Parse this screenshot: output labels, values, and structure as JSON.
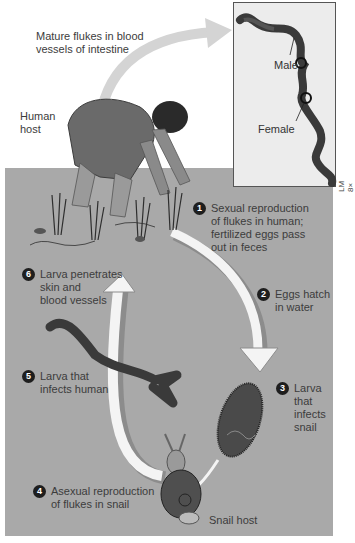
{
  "labels": {
    "mature_flukes": [
      "Mature flukes in blood",
      "vessels of intestine"
    ],
    "human_host": [
      "Human",
      "host"
    ],
    "snail_host": "Snail host",
    "male": "Male",
    "female": "Female",
    "magnification": "LM 8×"
  },
  "steps": [
    {
      "number": "1",
      "lines": [
        "Sexual reproduction",
        "of flukes in human;",
        "fertilized eggs pass",
        "out in feces"
      ]
    },
    {
      "number": "2",
      "lines": [
        "Eggs hatch",
        "in water"
      ]
    },
    {
      "number": "3",
      "lines": [
        "Larva",
        "that",
        "infects",
        "snail"
      ]
    },
    {
      "number": "4",
      "lines": [
        "Asexual reproduction",
        "of flukes in snail"
      ]
    },
    {
      "number": "5",
      "lines": [
        "Larva that",
        "infects human"
      ]
    },
    {
      "number": "6",
      "lines": [
        "Larva penetrates",
        "skin and",
        "blood vessels"
      ]
    }
  ],
  "colors": {
    "water": "#a9a9a9",
    "arrow": "#f4f4f4",
    "arrow_shadow": "#8c8c8c",
    "badge": "#1e1e1e",
    "organism": "#4a4a4a"
  }
}
